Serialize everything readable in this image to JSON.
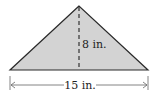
{
  "diagram": {
    "shape": "triangle",
    "fill_color": "#d3d3d3",
    "stroke_color": "#2a2a2a",
    "height_label": "8 in.",
    "base_label": "15 in."
  }
}
